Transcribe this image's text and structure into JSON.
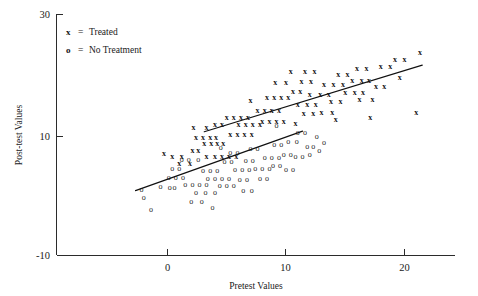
{
  "chart_data": {
    "type": "scatter",
    "title": "",
    "xlabel": "Pretest Values",
    "ylabel": "Post-test Values",
    "xlim": [
      -13,
      24.5
    ],
    "ylim": [
      -10,
      30
    ],
    "xticks": [
      0,
      10,
      20
    ],
    "xtick_labels": [
      "0",
      "10",
      "20"
    ],
    "yticks": [
      -10,
      10,
      30
    ],
    "ytick_labels": [
      "-10",
      "10",
      "30"
    ],
    "grid": false,
    "legend_position": "upper-left",
    "legend": [
      {
        "symbol": "x",
        "separator": "=",
        "label": "Treated"
      },
      {
        "symbol": "o",
        "separator": "=",
        "label": "No Treatment"
      }
    ],
    "series": [
      {
        "name": "Treated",
        "marker": "x",
        "points": [
          [
            -0.3,
            7.2
          ],
          [
            0.4,
            6.6
          ],
          [
            1.2,
            6.6
          ],
          [
            1.0,
            5.5
          ],
          [
            1.9,
            5.5
          ],
          [
            2.1,
            7.7
          ],
          [
            2.6,
            7.7
          ],
          [
            3.1,
            8.8
          ],
          [
            3.7,
            8.8
          ],
          [
            4.2,
            8.8
          ],
          [
            4.7,
            8.8
          ],
          [
            2.4,
            9.9
          ],
          [
            3.0,
            9.9
          ],
          [
            3.6,
            9.9
          ],
          [
            4.1,
            9.9
          ],
          [
            3.3,
            6.6
          ],
          [
            4.0,
            6.6
          ],
          [
            4.6,
            6.6
          ],
          [
            5.2,
            6.6
          ],
          [
            5.8,
            6.6
          ],
          [
            2.2,
            11.5
          ],
          [
            3.3,
            11.5
          ],
          [
            4.0,
            12.0
          ],
          [
            4.6,
            12.0
          ],
          [
            5.3,
            10.4
          ],
          [
            5.9,
            10.4
          ],
          [
            6.5,
            10.4
          ],
          [
            7.1,
            10.4
          ],
          [
            5.0,
            13.2
          ],
          [
            5.6,
            13.2
          ],
          [
            6.2,
            13.2
          ],
          [
            6.8,
            13.2
          ],
          [
            6.0,
            12.1
          ],
          [
            6.6,
            12.1
          ],
          [
            7.2,
            12.1
          ],
          [
            7.8,
            12.1
          ],
          [
            7.6,
            14.3
          ],
          [
            8.2,
            14.3
          ],
          [
            8.8,
            14.3
          ],
          [
            9.4,
            14.3
          ],
          [
            8.0,
            12.6
          ],
          [
            8.6,
            12.6
          ],
          [
            9.2,
            12.6
          ],
          [
            9.8,
            12.6
          ],
          [
            8.4,
            16.5
          ],
          [
            9.0,
            16.5
          ],
          [
            9.6,
            16.5
          ],
          [
            10.2,
            16.5
          ],
          [
            9.1,
            19.0
          ],
          [
            10.0,
            19.0
          ],
          [
            10.6,
            17.6
          ],
          [
            11.2,
            17.6
          ],
          [
            10.4,
            21.0
          ],
          [
            11.6,
            21.0
          ],
          [
            12.4,
            21.0
          ],
          [
            11.3,
            19.2
          ],
          [
            12.1,
            19.2
          ],
          [
            11.0,
            15.4
          ],
          [
            11.8,
            15.4
          ],
          [
            12.5,
            15.4
          ],
          [
            11.5,
            13.8
          ],
          [
            12.3,
            13.8
          ],
          [
            12.0,
            17.0
          ],
          [
            12.9,
            17.0
          ],
          [
            13.6,
            17.0
          ],
          [
            13.2,
            18.7
          ],
          [
            14.0,
            18.7
          ],
          [
            14.8,
            18.7
          ],
          [
            13.8,
            15.8
          ],
          [
            14.6,
            15.8
          ],
          [
            13.0,
            14.0
          ],
          [
            13.9,
            14.0
          ],
          [
            14.4,
            20.4
          ],
          [
            15.2,
            20.4
          ],
          [
            15.0,
            17.4
          ],
          [
            15.8,
            17.4
          ],
          [
            16.5,
            17.4
          ],
          [
            15.6,
            19.4
          ],
          [
            16.4,
            19.4
          ],
          [
            17.0,
            19.4
          ],
          [
            16.0,
            21.5
          ],
          [
            16.8,
            21.5
          ],
          [
            16.2,
            16.2
          ],
          [
            17.3,
            16.2
          ],
          [
            17.6,
            18.4
          ],
          [
            18.3,
            18.4
          ],
          [
            18.0,
            21.8
          ],
          [
            18.8,
            21.8
          ],
          [
            19.2,
            23.0
          ],
          [
            20.0,
            23.0
          ],
          [
            19.6,
            19.9
          ],
          [
            21.3,
            24.1
          ],
          [
            21.0,
            14.1
          ],
          [
            14.2,
            12.9
          ],
          [
            17.1,
            13.2
          ],
          [
            10.8,
            12.2
          ],
          [
            7.0,
            16.0
          ]
        ]
      },
      {
        "name": "No Treatment",
        "marker": "o",
        "points": [
          [
            -2.2,
            1.1
          ],
          [
            -2.0,
            -0.2
          ],
          [
            -1.4,
            -2.3
          ],
          [
            -0.6,
            1.6
          ],
          [
            0.2,
            1.5
          ],
          [
            0.6,
            1.5
          ],
          [
            0.1,
            3.1
          ],
          [
            0.7,
            3.1
          ],
          [
            1.3,
            3.1
          ],
          [
            0.4,
            4.7
          ],
          [
            1.0,
            4.7
          ],
          [
            1.2,
            6.2
          ],
          [
            1.8,
            6.2
          ],
          [
            2.6,
            6.2
          ],
          [
            1.5,
            2.0
          ],
          [
            2.1,
            2.0
          ],
          [
            2.7,
            2.0
          ],
          [
            3.3,
            2.0
          ],
          [
            2.4,
            0.6
          ],
          [
            3.2,
            0.6
          ],
          [
            4.0,
            0.6
          ],
          [
            2.0,
            -0.9
          ],
          [
            2.9,
            -0.9
          ],
          [
            3.0,
            4.3
          ],
          [
            3.6,
            4.3
          ],
          [
            4.2,
            4.3
          ],
          [
            3.4,
            3.0
          ],
          [
            4.0,
            3.0
          ],
          [
            4.6,
            3.0
          ],
          [
            5.2,
            3.0
          ],
          [
            4.4,
            1.8
          ],
          [
            5.0,
            1.8
          ],
          [
            5.6,
            1.8
          ],
          [
            4.8,
            5.8
          ],
          [
            5.4,
            5.8
          ],
          [
            5.3,
            7.3
          ],
          [
            5.9,
            7.3
          ],
          [
            5.7,
            4.4
          ],
          [
            6.3,
            4.4
          ],
          [
            6.9,
            4.4
          ],
          [
            6.1,
            2.7
          ],
          [
            6.7,
            2.7
          ],
          [
            6.4,
            0.9
          ],
          [
            7.1,
            0.9
          ],
          [
            6.6,
            6.0
          ],
          [
            7.2,
            6.0
          ],
          [
            7.0,
            8.0
          ],
          [
            7.6,
            8.0
          ],
          [
            7.4,
            4.6
          ],
          [
            8.0,
            4.6
          ],
          [
            8.6,
            4.6
          ],
          [
            7.8,
            2.9
          ],
          [
            8.4,
            2.9
          ],
          [
            8.2,
            6.4
          ],
          [
            8.8,
            6.4
          ],
          [
            9.4,
            6.4
          ],
          [
            8.9,
            5.1
          ],
          [
            9.5,
            5.1
          ],
          [
            9.0,
            8.7
          ],
          [
            9.6,
            8.7
          ],
          [
            9.8,
            7.0
          ],
          [
            10.4,
            7.0
          ],
          [
            10.0,
            4.4
          ],
          [
            10.6,
            4.4
          ],
          [
            10.2,
            9.2
          ],
          [
            10.9,
            9.2
          ],
          [
            10.8,
            6.6
          ],
          [
            11.4,
            6.6
          ],
          [
            11.0,
            10.6
          ],
          [
            11.6,
            10.6
          ],
          [
            11.8,
            8.4
          ],
          [
            12.3,
            8.4
          ],
          [
            12.0,
            6.9
          ],
          [
            12.6,
            10.0
          ],
          [
            12.8,
            7.6
          ],
          [
            13.2,
            9.0
          ],
          [
            9.2,
            11.8
          ],
          [
            4.5,
            8.2
          ],
          [
            3.8,
            -1.9
          ]
        ]
      }
    ],
    "fit_lines": [
      {
        "name": "treated-fit-line",
        "for_series": "Treated",
        "x_start": 3.1,
        "y_start": 10.8,
        "x_end": 21.5,
        "y_end": 22.0
      },
      {
        "name": "control-fit-line",
        "for_series": "No Treatment",
        "x_start": -2.7,
        "y_start": 0.9,
        "x_end": 11.4,
        "y_end": 10.9
      }
    ]
  }
}
